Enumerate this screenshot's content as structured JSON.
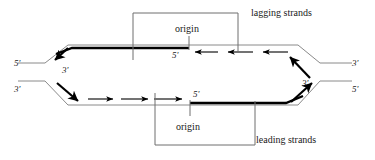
{
  "diagram": {
    "colors": {
      "background": "#ffffff",
      "template_strand": "#8a8a8a",
      "new_strand": "#000000",
      "bracket": "#6e6e6e",
      "text": "#1a1a1a"
    },
    "labels": {
      "origin_top": "origin",
      "origin_bottom": "origin",
      "lagging_strands": "lagging strands",
      "leading_strands": "leading strands"
    },
    "end_labels": {
      "left_upper": "5'",
      "left_lower": "3'",
      "right_upper": "3'",
      "right_lower": "5'"
    },
    "fork_labels": {
      "left_inner": "3'",
      "right_inner": "3'"
    },
    "strand_start_labels": {
      "top_five_prime": "5'",
      "bottom_five_prime": "5'"
    },
    "arrow_counts": {
      "lagging_top_leftward": 3,
      "leading_bottom_rightward": 3,
      "left_fork_diagonal": 2,
      "right_fork_diagonal": 2
    }
  }
}
